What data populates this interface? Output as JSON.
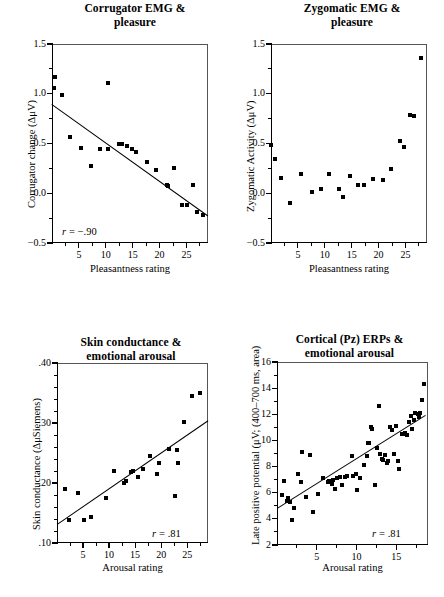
{
  "figure": {
    "panel_count": 4,
    "marker": "filled-square",
    "marker_color": "#000000",
    "line_color": "#000000",
    "frame_color": "#555555",
    "background": "#ffffff"
  },
  "panels": [
    {
      "id": "corrugator-emg-pleasure",
      "title_line1": "Corrugator EMG &",
      "title_line2": "pleasure",
      "xlabel": "Pleasantness rating",
      "ylabel": "Corrugator change (ΔμV)",
      "annotation": "r = −.90",
      "annotation_r_symbol": "r",
      "annotation_value": "= −.90",
      "yticks": [
        "1.5",
        "1.0",
        "0.5",
        "0.0",
        "−0.5"
      ],
      "ytickvals": [
        1.5,
        1.0,
        0.5,
        0.0,
        -0.5
      ],
      "xticks": [
        "5",
        "10",
        "15",
        "20",
        "25"
      ],
      "xtickvals": [
        5,
        10,
        15,
        20,
        25
      ]
    },
    {
      "id": "zygomatic-emg-pleasure",
      "title_line1": "Zygomatic EMG &",
      "title_line2": "pleasure",
      "xlabel": "Pleasantness rating",
      "ylabel": "Zygomatic Activity (ΔμV)",
      "annotation": "",
      "annotation_r_symbol": "",
      "annotation_value": "",
      "yticks": [
        "1.5",
        "1.0",
        "0.5",
        "0.0",
        "−0.5"
      ],
      "ytickvals": [
        1.5,
        1.0,
        0.5,
        0.0,
        -0.5
      ],
      "xticks": [
        "5",
        "10",
        "15",
        "20",
        "25"
      ],
      "xtickvals": [
        5,
        10,
        15,
        20,
        25
      ]
    },
    {
      "id": "skin-conductance-arousal",
      "title_line1": "Skin conductance &",
      "title_line2": "emotional arousal",
      "xlabel": "Arousal rating",
      "ylabel": "Skin conductance (ΔμSiemens)",
      "annotation": "r = .81",
      "annotation_r_symbol": "r",
      "annotation_value": "= .81",
      "yticks": [
        ".40",
        ".30",
        ".20",
        ".10"
      ],
      "ytickvals": [
        0.4,
        0.3,
        0.2,
        0.1
      ],
      "xticks": [
        "5",
        "10",
        "15",
        "20",
        "25"
      ],
      "xtickvals": [
        5,
        10,
        15,
        20,
        25
      ]
    },
    {
      "id": "cortical-pz-erps-arousal",
      "title_line1": "Cortical (Pz) ERPs &",
      "title_line2": "emotional arousal",
      "xlabel": "Arousal rating",
      "ylabel": "Late positive potential (μV; (400–700 ms, area)",
      "annotation": "r = .81",
      "annotation_r_symbol": "r",
      "annotation_value": "= .81",
      "yticks": [
        "16",
        "14",
        "12",
        "10",
        "8",
        "6",
        "4",
        "2"
      ],
      "ytickvals": [
        16,
        14,
        12,
        10,
        8,
        6,
        4,
        2
      ],
      "xticks": [
        "5",
        "10",
        "15"
      ],
      "xtickvals": [
        5,
        10,
        15
      ]
    }
  ],
  "chart_data": [
    {
      "type": "scatter",
      "id": "corrugator-emg-pleasure",
      "title": "Corrugator EMG & pleasure",
      "xlabel": "Pleasantness rating",
      "ylabel": "Corrugator change (ΔμV)",
      "xlim": [
        0,
        29
      ],
      "ylim": [
        -0.5,
        1.5
      ],
      "grid": false,
      "legend": false,
      "annotations": [
        "r = −.90"
      ],
      "correlation": -0.9,
      "trendline": {
        "x0": 0,
        "y0": 0.9,
        "x1": 29,
        "y1": -0.22
      },
      "points": [
        [
          0.5,
          1.17
        ],
        [
          0.3,
          1.06
        ],
        [
          1.9,
          0.99
        ],
        [
          3.4,
          0.57
        ],
        [
          5.3,
          0.45
        ],
        [
          7.3,
          0.27
        ],
        [
          8.9,
          0.44
        ],
        [
          10.5,
          0.44
        ],
        [
          10.4,
          1.11
        ],
        [
          12.4,
          0.5
        ],
        [
          13.0,
          0.49
        ],
        [
          13.9,
          0.47
        ],
        [
          14.9,
          0.44
        ],
        [
          15.6,
          0.41
        ],
        [
          17.6,
          0.31
        ],
        [
          19.3,
          0.23
        ],
        [
          21.3,
          0.08
        ],
        [
          21.6,
          0.07
        ],
        [
          22.7,
          0.25
        ],
        [
          24.1,
          -0.12
        ],
        [
          25.1,
          -0.12
        ],
        [
          26.3,
          0.08
        ],
        [
          27.0,
          -0.19
        ],
        [
          28.0,
          -0.22
        ]
      ]
    },
    {
      "type": "scatter",
      "id": "zygomatic-emg-pleasure",
      "title": "Zygomatic EMG & pleasure",
      "xlabel": "Pleasantness rating",
      "ylabel": "Zygomatic Activity (ΔμV)",
      "xlim": [
        0,
        29
      ],
      "ylim": [
        -0.5,
        1.5
      ],
      "grid": false,
      "legend": false,
      "annotations": [],
      "trendline": null,
      "points": [
        [
          0.0,
          0.48
        ],
        [
          0.7,
          0.34
        ],
        [
          1.9,
          0.15
        ],
        [
          3.5,
          -0.1
        ],
        [
          5.5,
          0.19
        ],
        [
          7.7,
          0.01
        ],
        [
          9.3,
          0.04
        ],
        [
          10.8,
          0.19
        ],
        [
          12.6,
          0.04
        ],
        [
          13.3,
          -0.04
        ],
        [
          14.6,
          0.17
        ],
        [
          16.2,
          0.08
        ],
        [
          17.3,
          0.08
        ],
        [
          18.9,
          0.14
        ],
        [
          20.8,
          0.13
        ],
        [
          22.4,
          0.24
        ],
        [
          23.9,
          0.53
        ],
        [
          24.8,
          0.46
        ],
        [
          25.8,
          0.79
        ],
        [
          26.5,
          0.78
        ],
        [
          27.9,
          1.36
        ]
      ]
    },
    {
      "type": "scatter",
      "id": "skin-conductance-arousal",
      "title": "Skin conductance & emotional arousal",
      "xlabel": "Arousal rating",
      "ylabel": "Skin conductance (ΔμSiemens)",
      "xlim": [
        0,
        29
      ],
      "ylim": [
        0.1,
        0.4
      ],
      "grid": false,
      "legend": false,
      "annotations": [
        "r = .81"
      ],
      "correlation": 0.81,
      "trendline": {
        "x0": 0,
        "y0": 0.131,
        "x1": 29,
        "y1": 0.304
      },
      "points": [
        [
          1.6,
          0.19
        ],
        [
          2.4,
          0.138
        ],
        [
          4.1,
          0.184
        ],
        [
          5.2,
          0.138
        ],
        [
          6.6,
          0.143
        ],
        [
          9.4,
          0.175
        ],
        [
          11.0,
          0.22
        ],
        [
          12.9,
          0.2
        ],
        [
          13.2,
          0.204
        ],
        [
          14.3,
          0.218
        ],
        [
          14.6,
          0.22
        ],
        [
          15.5,
          0.21
        ],
        [
          16.6,
          0.223
        ],
        [
          17.8,
          0.245
        ],
        [
          19.3,
          0.215
        ],
        [
          19.6,
          0.234
        ],
        [
          21.6,
          0.256
        ],
        [
          22.7,
          0.178
        ],
        [
          23.0,
          0.255
        ],
        [
          23.3,
          0.234
        ],
        [
          24.4,
          0.302
        ],
        [
          26.0,
          0.345
        ],
        [
          27.4,
          0.35
        ]
      ]
    },
    {
      "type": "scatter",
      "id": "cortical-pz-erps-arousal",
      "title": "Cortical (Pz) ERPs & emotional arousal",
      "xlabel": "Arousal rating",
      "ylabel": "Late positive potential (μV; (400–700 ms, area)",
      "xlim": [
        0,
        19
      ],
      "ylim": [
        2,
        16
      ],
      "grid": false,
      "legend": false,
      "annotations": [
        "r = .81"
      ],
      "correlation": 0.81,
      "trendline": {
        "x0": 0,
        "y0": 4.85,
        "x1": 18.6,
        "y1": 11.95
      },
      "points": [
        [
          0.6,
          5.8
        ],
        [
          0.9,
          6.9
        ],
        [
          1.2,
          5.4
        ],
        [
          1.4,
          5.6
        ],
        [
          1.6,
          5.3
        ],
        [
          1.9,
          3.9
        ],
        [
          2.2,
          4.8
        ],
        [
          2.6,
          7.4
        ],
        [
          3.0,
          6.8
        ],
        [
          3.1,
          9.1
        ],
        [
          3.6,
          5.7
        ],
        [
          4.2,
          8.9
        ],
        [
          4.5,
          4.5
        ],
        [
          5.2,
          5.9
        ],
        [
          5.8,
          7.1
        ],
        [
          6.4,
          6.8
        ],
        [
          6.6,
          6.9
        ],
        [
          6.9,
          6.7
        ],
        [
          7.1,
          7.0
        ],
        [
          7.3,
          6.3
        ],
        [
          7.6,
          7.1
        ],
        [
          7.9,
          7.2
        ],
        [
          8.2,
          6.6
        ],
        [
          8.6,
          7.2
        ],
        [
          8.8,
          7.3
        ],
        [
          9.4,
          8.8
        ],
        [
          9.6,
          7.3
        ],
        [
          9.9,
          7.4
        ],
        [
          10.1,
          6.2
        ],
        [
          10.4,
          7.1
        ],
        [
          11.0,
          8.1
        ],
        [
          11.3,
          8.8
        ],
        [
          11.5,
          9.8
        ],
        [
          11.6,
          9.8
        ],
        [
          11.8,
          11.0
        ],
        [
          11.9,
          10.9
        ],
        [
          12.3,
          6.6
        ],
        [
          12.6,
          9.4
        ],
        [
          12.8,
          12.6
        ],
        [
          13.0,
          9.0
        ],
        [
          13.2,
          8.6
        ],
        [
          13.4,
          8.5
        ],
        [
          13.6,
          8.9
        ],
        [
          13.8,
          8.3
        ],
        [
          14.0,
          8.4
        ],
        [
          14.2,
          11.0
        ],
        [
          14.5,
          10.8
        ],
        [
          14.7,
          9.0
        ],
        [
          15.0,
          11.1
        ],
        [
          15.2,
          8.4
        ],
        [
          15.4,
          7.8
        ],
        [
          15.7,
          10.5
        ],
        [
          15.9,
          10.5
        ],
        [
          16.1,
          10.6
        ],
        [
          16.3,
          10.4
        ],
        [
          16.6,
          11.4
        ],
        [
          16.8,
          11.9
        ],
        [
          17.0,
          10.9
        ],
        [
          17.2,
          11.6
        ],
        [
          17.4,
          12.1
        ],
        [
          17.7,
          12.0
        ],
        [
          17.9,
          11.8
        ],
        [
          18.0,
          12.1
        ],
        [
          18.2,
          13.1
        ],
        [
          18.5,
          14.35
        ]
      ]
    }
  ]
}
